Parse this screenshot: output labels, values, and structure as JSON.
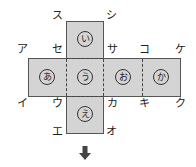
{
  "diagram": {
    "type": "cube-net",
    "faces": {
      "top": "い",
      "row": [
        "あ",
        "う",
        "お",
        "か"
      ],
      "bottom": "え"
    },
    "vertex_labels": {
      "su": "ス",
      "shi": "シ",
      "a": "ア",
      "se": "セ",
      "sa": "サ",
      "ko": "コ",
      "ke": "ケ",
      "i": "イ",
      "u": "ウ",
      "ka": "カ",
      "ki": "キ",
      "ku": "ク",
      "e": "エ",
      "o": "オ"
    },
    "arrow": "↓",
    "colors": {
      "face_fill": "#d4d4d4",
      "line": "#555555"
    }
  }
}
